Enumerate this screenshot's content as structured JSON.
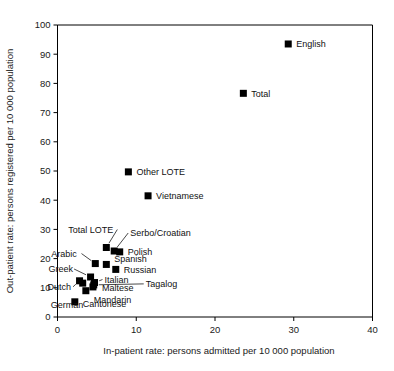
{
  "chart_data": {
    "type": "scatter",
    "title": "",
    "xlabel": "In-patient rate: persons admitted per 10 000 population",
    "ylabel": "Out-patient rate: persons registered per 10 000 population",
    "xlim": [
      0,
      40
    ],
    "ylim": [
      0,
      100
    ],
    "xticks": [
      "0",
      "10",
      "20",
      "30",
      "40"
    ],
    "yticks": [
      "0",
      "10",
      "20",
      "30",
      "40",
      "50",
      "60",
      "70",
      "80",
      "90",
      "100"
    ],
    "grid": false,
    "legend": "none",
    "marker_style": "filled-square",
    "marker_color": "#000000",
    "points": [
      {
        "label": "English",
        "x": 29.3,
        "y": 93.5,
        "label_dx": 8,
        "label_dy": 3.5,
        "leader": false
      },
      {
        "label": "Total",
        "x": 23.6,
        "y": 76.6,
        "label_dx": 8,
        "label_dy": 3.5,
        "leader": false
      },
      {
        "label": "Other LOTE",
        "x": 9.0,
        "y": 49.7,
        "label_dx": 8,
        "label_dy": 3.5,
        "leader": false
      },
      {
        "label": "Vietnamese",
        "x": 11.5,
        "y": 41.5,
        "label_dx": 8,
        "label_dy": 3.5,
        "leader": false
      },
      {
        "label": "Total LOTE",
        "x": 6.2,
        "y": 23.8,
        "label_dx": -38,
        "label_dy": -15,
        "leader": true
      },
      {
        "label": "Serbo/Croatian",
        "x": 7.2,
        "y": 22.6,
        "label_dx": 16,
        "label_dy": -15,
        "leader": true
      },
      {
        "label": "Polish",
        "x": 7.9,
        "y": 22.3,
        "label_dx": 8,
        "label_dy": 3.5,
        "leader": false
      },
      {
        "label": "Arabic",
        "x": 4.8,
        "y": 18.3,
        "label_dx": -44,
        "label_dy": -7,
        "leader": true
      },
      {
        "label": "Spanish",
        "x": 6.2,
        "y": 18.0,
        "label_dx": 8,
        "label_dy": -2,
        "leader": false
      },
      {
        "label": "Russian",
        "x": 7.4,
        "y": 16.3,
        "label_dx": 8,
        "label_dy": 3.5,
        "leader": false
      },
      {
        "label": "Greek",
        "x": 4.2,
        "y": 13.7,
        "label_dx": -42,
        "label_dy": -5,
        "leader": true
      },
      {
        "label": "Italian",
        "x": 4.7,
        "y": 11.8,
        "label_dx": 10,
        "label_dy": 0,
        "leader": true
      },
      {
        "label": "Dutch",
        "x": 2.8,
        "y": 12.4,
        "label_dx": -32,
        "label_dy": 9,
        "leader": true
      },
      {
        "label": "Tagalog",
        "x": 4.6,
        "y": 11.0,
        "label_dx": 52,
        "label_dy": 2,
        "leader": true
      },
      {
        "label": "Maltese",
        "x": 4.5,
        "y": 10.3,
        "label_dx": 9,
        "label_dy": 4,
        "leader": false
      },
      {
        "label": "Mandarin",
        "x": 3.6,
        "y": 9.0,
        "label_dx": 8,
        "label_dy": 12,
        "leader": false
      },
      {
        "label": "Cantonese",
        "x": 2.2,
        "y": 5.2,
        "label_dx": 8,
        "label_dy": 5,
        "leader": false
      },
      {
        "label": "German",
        "x": 3.2,
        "y": 11.6,
        "label_dx": -32,
        "label_dy": 25,
        "leader": false
      }
    ]
  }
}
